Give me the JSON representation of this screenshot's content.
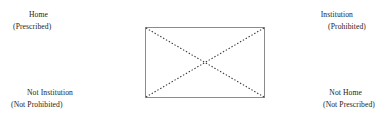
{
  "diagram": {
    "figure": {
      "shape_name": "rectangle",
      "border_color": "#8b8b8b",
      "diagonal_style": "dotted",
      "diagonal_color": "#3a3a3a",
      "fill_color": "#ffffff"
    },
    "labels": {
      "top_left": {
        "primary": "Home",
        "secondary": "(Prescribed)"
      },
      "top_right": {
        "primary": "Institution",
        "secondary": "(Prohibited)"
      },
      "bottom_left": {
        "primary": "Not Institution",
        "secondary": "(Not Prohibited)"
      },
      "bottom_right": {
        "primary": "Not Home",
        "secondary": "(Not Prescribed)"
      }
    }
  }
}
